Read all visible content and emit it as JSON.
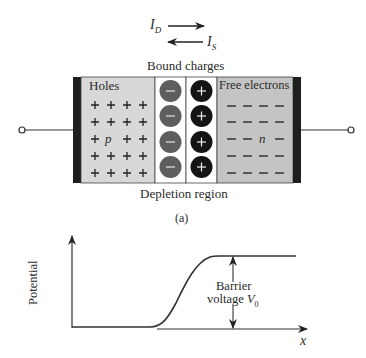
{
  "currents": {
    "drift_label": "I",
    "drift_sub": "D",
    "diffusion_label": "I",
    "diffusion_sub": "S"
  },
  "junction": {
    "top_label": "Bound charges",
    "bottom_label": "Depletion region",
    "p_region": {
      "title": "Holes",
      "type_letter": "p",
      "carrier_symbol": "+"
    },
    "n_region": {
      "title": "Free electrons",
      "type_letter": "n",
      "carrier_symbol": "–"
    },
    "bound_negative_symbol": "−",
    "bound_positive_symbol": "+",
    "colors": {
      "p_fill": "#d8d8d8",
      "n_fill": "#c4c4c4",
      "contact": "#1e1e1e",
      "negative_ion": "#5e5e5e",
      "positive_ion": "#141414",
      "depletion_fill": "#ffffff"
    }
  },
  "caption": "(a)",
  "potential_plot": {
    "ylabel": "Potential",
    "xlabel": "x",
    "annotation_line1": "Barrier",
    "annotation_line2": "voltage",
    "annotation_symbol": "V",
    "annotation_sub": "0"
  }
}
